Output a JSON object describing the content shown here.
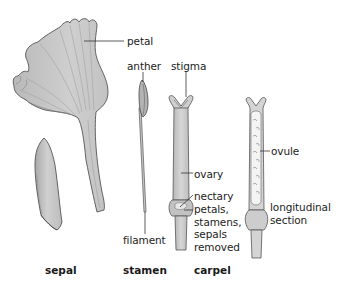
{
  "figure": {
    "type": "botanical-illustration"
  },
  "labels": {
    "petal": "petal",
    "anther": "anther",
    "stigma": "stigma",
    "ovary": "ovary",
    "nectary": "nectary",
    "petals_removed": "petals,\nstamens,\nsepals\nremoved",
    "filament": "filament",
    "ovule": "ovule",
    "longitudinal_section": "longitudinal\nsection"
  },
  "captions": {
    "sepal": "sepal",
    "stamen": "stamen",
    "carpel": "carpel"
  },
  "colors": {
    "fill": "#c8c8c8",
    "fill_light": "#dcdcdc",
    "stroke": "#555555",
    "leader": "#333333",
    "text": "#222222"
  }
}
